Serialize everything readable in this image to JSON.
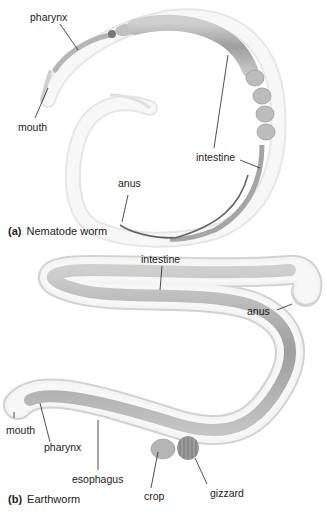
{
  "panels": [
    {
      "letter": "(a)",
      "title": "Nematode worm",
      "labels": {
        "pharynx": "pharynx",
        "mouth": "mouth",
        "intestine": "intestine",
        "anus": "anus"
      }
    },
    {
      "letter": "(b)",
      "title": "Earthworm",
      "labels": {
        "intestine": "intestine",
        "anus": "anus",
        "mouth": "mouth",
        "pharynx": "pharynx",
        "esophagus": "esophagus",
        "crop": "crop",
        "gizzard": "gizzard"
      }
    }
  ],
  "colors": {
    "body_outline": "#bdbdbd",
    "gut_fill": "#a9a9a9",
    "skin_fill": "#f2f2f2",
    "label_line": "#222222"
  }
}
